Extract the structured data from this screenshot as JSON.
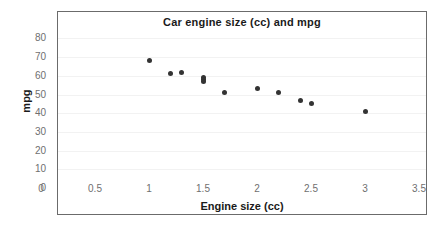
{
  "chart_data": {
    "type": "scatter",
    "title": "Car engine size (cc) and mpg",
    "xlabel": "Engine size (cc)",
    "ylabel": "mpg",
    "xlim": [
      0,
      3.5
    ],
    "ylim": [
      0,
      80
    ],
    "xticks": [
      "0",
      "0.5",
      "1",
      "1.5",
      "2",
      "2.5",
      "3",
      "3.5"
    ],
    "xtick_values": [
      0,
      0.5,
      1,
      1.5,
      2,
      2.5,
      3,
      3.5
    ],
    "yticks": [
      "0",
      "10",
      "20",
      "30",
      "40",
      "50",
      "60",
      "70",
      "80"
    ],
    "ytick_values": [
      0,
      10,
      20,
      30,
      40,
      50,
      60,
      70,
      80
    ],
    "grid": true,
    "legend": false,
    "marker_color": "#333333",
    "series": [
      {
        "name": "Cars",
        "points": [
          {
            "x": 1.0,
            "y": 68
          },
          {
            "x": 1.2,
            "y": 61
          },
          {
            "x": 1.3,
            "y": 62
          },
          {
            "x": 1.5,
            "y": 59
          },
          {
            "x": 1.5,
            "y": 58
          },
          {
            "x": 1.5,
            "y": 57
          },
          {
            "x": 1.7,
            "y": 51
          },
          {
            "x": 2.0,
            "y": 53
          },
          {
            "x": 2.2,
            "y": 51
          },
          {
            "x": 2.4,
            "y": 47
          },
          {
            "x": 2.5,
            "y": 45
          },
          {
            "x": 3.0,
            "y": 41
          }
        ]
      }
    ]
  }
}
